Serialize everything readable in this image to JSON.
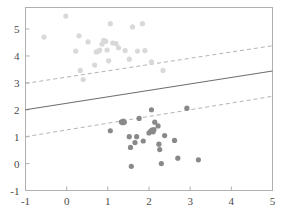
{
  "chart_data": {
    "type": "scatter",
    "title": "",
    "xlabel": "",
    "ylabel": "",
    "xlim": [
      -1,
      5
    ],
    "ylim": [
      -1,
      5.8
    ],
    "grid": false,
    "legend": null,
    "xticks": [
      -1,
      0,
      1,
      2,
      3,
      4,
      5
    ],
    "xtick_labels": [
      "-1",
      "0",
      "1",
      "2",
      "3",
      "4",
      "5"
    ],
    "yticks": [
      -1,
      0,
      1,
      2,
      3,
      4,
      5
    ],
    "ytick_labels": [
      "-1",
      "0",
      "1",
      "2",
      "3",
      "4",
      "5"
    ],
    "colors": {
      "class_upper": "#d9d9d9",
      "class_lower": "#898989",
      "solid_line": "#6e6e6e",
      "dashed_line": "#b4b4b4",
      "axis": "#b0b0b0",
      "tick_label": "#4a4a4a"
    },
    "marker_radius": 2.6,
    "lines": [
      {
        "name": "decision-boundary",
        "style": "solid",
        "color": "#6e6e6e",
        "x": [
          -1,
          5
        ],
        "y": [
          2.0,
          3.44
        ],
        "slope": 0.24,
        "intercept": 2.24
      },
      {
        "name": "upper-margin",
        "style": "dashed",
        "color": "#b4b4b4",
        "x": [
          -1,
          5
        ],
        "y": [
          2.98,
          4.38
        ],
        "slope": 0.2333,
        "intercept": 3.2133
      },
      {
        "name": "lower-margin",
        "style": "dashed",
        "color": "#b4b4b4",
        "x": [
          -1,
          5
        ],
        "y": [
          1.0,
          2.5
        ],
        "slope": 0.25,
        "intercept": 1.25
      }
    ],
    "series": [
      {
        "name": "class-upper",
        "color": "#d9d9d9",
        "points": [
          [
            -0.55,
            4.7
          ],
          [
            -0.02,
            5.48
          ],
          [
            0.22,
            4.18
          ],
          [
            0.3,
            4.75
          ],
          [
            0.33,
            3.46
          ],
          [
            0.4,
            3.12
          ],
          [
            0.52,
            4.52
          ],
          [
            0.68,
            3.66
          ],
          [
            0.72,
            4.15
          ],
          [
            0.78,
            4.18
          ],
          [
            0.8,
            4.22
          ],
          [
            0.86,
            4.44
          ],
          [
            0.9,
            4.58
          ],
          [
            0.95,
            4.54
          ],
          [
            0.98,
            4.22
          ],
          [
            1.02,
            3.82
          ],
          [
            1.06,
            5.2
          ],
          [
            1.12,
            4.48
          ],
          [
            1.2,
            4.46
          ],
          [
            1.26,
            4.3
          ],
          [
            1.42,
            4.2
          ],
          [
            1.52,
            3.88
          ],
          [
            1.6,
            5.08
          ],
          [
            1.72,
            4.18
          ],
          [
            1.84,
            5.2
          ],
          [
            1.9,
            4.2
          ],
          [
            2.06,
            3.78
          ],
          [
            2.34,
            3.46
          ]
        ]
      },
      {
        "name": "class-lower",
        "color": "#898989",
        "points": [
          [
            1.06,
            1.22
          ],
          [
            1.33,
            1.55
          ],
          [
            1.36,
            1.52
          ],
          [
            1.38,
            1.58
          ],
          [
            1.4,
            1.54
          ],
          [
            1.52,
            1.0
          ],
          [
            1.55,
            0.6
          ],
          [
            1.57,
            -0.1
          ],
          [
            1.66,
            0.78
          ],
          [
            1.7,
            1.0
          ],
          [
            1.76,
            1.68
          ],
          [
            1.86,
            0.84
          ],
          [
            2.0,
            1.14
          ],
          [
            2.04,
            1.2
          ],
          [
            2.07,
            1.24
          ],
          [
            2.1,
            1.18
          ],
          [
            2.12,
            1.26
          ],
          [
            2.06,
            2.0
          ],
          [
            2.14,
            1.54
          ],
          [
            2.22,
            1.4
          ],
          [
            2.24,
            0.72
          ],
          [
            2.26,
            0.52
          ],
          [
            2.3,
            0.0
          ],
          [
            2.38,
            1.04
          ],
          [
            2.62,
            0.86
          ],
          [
            2.7,
            0.2
          ],
          [
            2.92,
            2.06
          ],
          [
            3.2,
            0.14
          ]
        ]
      }
    ]
  }
}
